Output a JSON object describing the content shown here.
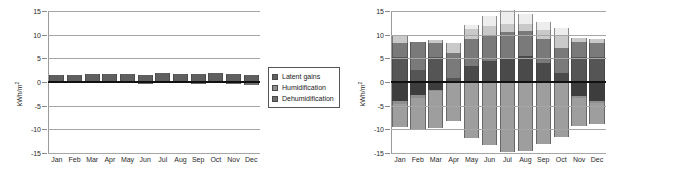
{
  "figures": [
    {
      "id": "latent-energy-chart",
      "axis": {
        "ylabel": "kWh/m",
        "ylabel_sup": "2",
        "yticks": [
          "15",
          "10",
          "5",
          "0",
          "-5",
          "-10",
          "-15"
        ],
        "ymin": -15,
        "ymax": 15
      },
      "legend": [
        {
          "label": "Latent gains",
          "color": "#5f5f5f"
        },
        {
          "label": "Humidification",
          "color": "#8e8e8e"
        },
        {
          "label": "Dehumidification",
          "color": "#6e6e6e"
        }
      ],
      "chart_data": {
        "type": "bar",
        "stacked": true,
        "title": "",
        "xlabel": "",
        "ylabel": "kWh/m2",
        "ylim": [
          -15,
          15
        ],
        "grid": true,
        "legend_position": "right",
        "categories": [
          "Jan",
          "Feb",
          "Mar",
          "Apr",
          "May",
          "Jun",
          "Jul",
          "Aug",
          "Sep",
          "Oct",
          "Nov",
          "Dec"
        ],
        "series": [
          {
            "name": "Latent gains",
            "color": "#5f5f5f",
            "values": [
              1.5,
              1.5,
              1.6,
              1.6,
              1.6,
              1.5,
              1.9,
              1.7,
              1.7,
              1.8,
              1.6,
              1.5
            ]
          },
          {
            "name": "Humidification",
            "color": "#8e8e8e",
            "values": [
              0,
              0,
              0,
              0,
              0,
              0,
              0,
              0,
              0,
              0,
              0,
              0
            ]
          },
          {
            "name": "Dehumidification",
            "color": "#6e6e6e",
            "values": [
              -0.3,
              -0.3,
              -0.3,
              -0.3,
              -0.3,
              -0.5,
              -0.3,
              -0.3,
              -0.4,
              -0.3,
              -0.4,
              -0.6
            ]
          }
        ]
      }
    },
    {
      "id": "sensible-energy-chart",
      "axis": {
        "ylabel": "kWh/m",
        "ylabel_sup": "2",
        "yticks": [
          "15",
          "10",
          "5",
          "0",
          "-5",
          "-10",
          "-15"
        ],
        "ymin": -15,
        "ymax": 15
      },
      "legend": [
        {
          "label": "Cooling",
          "color": "#5c5c5c"
        },
        {
          "label": "Ventilation",
          "color": "#a0a0a0"
        },
        {
          "label": "Infiltration",
          "color": "#f2f2f2"
        },
        {
          "label": "Heating",
          "color": "#8c8c8c"
        },
        {
          "label": "Solar",
          "color": "#d9d9d9"
        },
        {
          "label": "Internal",
          "color": "#4a4a4a"
        },
        {
          "label": "Air from sunspace buffer",
          "color": "#9a9a9a"
        },
        {
          "label": "Conduction",
          "color": "#3d3d3d"
        }
      ],
      "chart_data": {
        "type": "bar",
        "stacked": true,
        "title": "",
        "xlabel": "",
        "ylabel": "kWh/m2",
        "ylim": [
          -15,
          15
        ],
        "grid": true,
        "legend_position": "right",
        "categories": [
          "Jan",
          "Feb",
          "Mar",
          "Apr",
          "May",
          "Jun",
          "Jul",
          "Aug",
          "Sep",
          "Oct",
          "Nov",
          "Dec"
        ],
        "series": [
          {
            "name": "Heating",
            "color": "#555555",
            "values": [
              5.3,
              2.5,
              5.3,
              0.9,
              0.0,
              0.0,
              0.0,
              0.0,
              0.0,
              0.0,
              5.2,
              5.3
            ]
          },
          {
            "name": "Internal",
            "color": "#4a4a4a",
            "values": [
              0.0,
              0.0,
              0.0,
              0.0,
              3.4,
              4.4,
              5.0,
              5.4,
              4.0,
              1.8,
              0.0,
              0.0
            ]
          },
          {
            "name": "Solar",
            "color": "#7a7a7a",
            "values": [
              3.0,
              6.0,
              3.0,
              5.2,
              5.6,
              5.6,
              5.6,
              5.4,
              5.0,
              5.3,
              3.2,
              3.0
            ]
          },
          {
            "name": "Infiltration",
            "color": "#c9c9c9",
            "values": [
              1.7,
              0.0,
              0.5,
              2.2,
              2.2,
              1.9,
              1.6,
              1.4,
              2.0,
              2.7,
              1.0,
              0.7
            ]
          },
          {
            "name": "Ventilation",
            "color": "#ededed",
            "values": [
              0.0,
              0.0,
              0.0,
              0.0,
              0.8,
              2.1,
              3.0,
              2.2,
              1.6,
              1.7,
              0.0,
              0.0
            ]
          },
          {
            "name": "Conduction",
            "color": "#3d3d3d",
            "values": [
              -4.1,
              -2.7,
              -1.6,
              0.0,
              0.0,
              0.0,
              0.0,
              0.0,
              0.0,
              0.0,
              -2.9,
              -4.0
            ]
          },
          {
            "name": "Air from sunspace buffer",
            "color": "#8f8f8f",
            "values": [
              -0.5,
              -0.6,
              -0.3,
              -0.3,
              -0.3,
              -0.3,
              -0.3,
              -0.3,
              -0.3,
              -0.3,
              -0.4,
              -0.5
            ]
          },
          {
            "name": "Cooling",
            "color": "#9e9e9e",
            "values": [
              -4.9,
              -6.6,
              -7.9,
              -7.9,
              -11.6,
              -13.0,
              -14.4,
              -14.3,
              -12.7,
              -11.4,
              -6.0,
              -4.4
            ]
          }
        ]
      }
    }
  ]
}
